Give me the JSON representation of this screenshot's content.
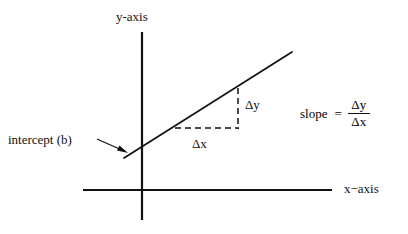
{
  "diagram": {
    "axes": {
      "y_label": "y-axis",
      "x_label": "x−axis",
      "origin_x": 142,
      "origin_y": 190,
      "y_axis_top": 32,
      "y_axis_bottom": 220,
      "x_axis_left": 83,
      "x_axis_right": 332,
      "stroke_color": "#111111",
      "stroke_width": 2.2
    },
    "line": {
      "name": "sloped-line",
      "x1": 124,
      "y1": 158,
      "x2": 292,
      "y2": 52,
      "stroke_color": "#111111",
      "stroke_width": 1.6
    },
    "rise_run_triangle": {
      "run_y": 128,
      "run_x_start": 175,
      "run_x_end": 238,
      "rise_x": 238,
      "rise_y_top": 88,
      "rise_y_bottom": 128,
      "dash_pattern": "6 4",
      "stroke_color": "#111111",
      "stroke_width": 1.4,
      "delta_y_label": "Δy",
      "delta_x_label": "Δx"
    },
    "intercept_annotation": {
      "label": "intercept (b)",
      "arrow_x1": 97,
      "arrow_y1": 139,
      "arrow_x2": 127,
      "arrow_y2": 153,
      "stroke_color": "#111111",
      "stroke_width": 1.2
    },
    "slope_formula": {
      "word": "slope",
      "equals": "=",
      "numerator": "Δy",
      "denominator": "Δx"
    }
  }
}
